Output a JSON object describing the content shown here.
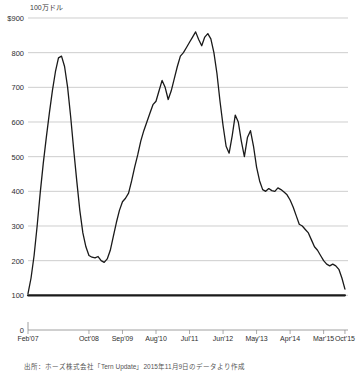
{
  "chart_data": {
    "type": "line",
    "title": "100万ドル",
    "xlabel": "",
    "ylabel": "",
    "ylim": [
      0,
      900
    ],
    "xlim": [
      0,
      105
    ],
    "grid": true,
    "legend": "none",
    "y_ticks": [
      {
        "value": 900,
        "label": "$900"
      },
      {
        "value": 800,
        "label": "800"
      },
      {
        "value": 700,
        "label": "700"
      },
      {
        "value": 600,
        "label": "600"
      },
      {
        "value": 500,
        "label": "500"
      },
      {
        "value": 400,
        "label": "400"
      },
      {
        "value": 300,
        "label": "300"
      },
      {
        "value": 200,
        "label": "200"
      },
      {
        "value": 100,
        "label": "100"
      },
      {
        "value": 0,
        "label": "0"
      }
    ],
    "x_ticks": [
      {
        "index": 0,
        "label": "Feb'07"
      },
      {
        "index": 20,
        "label": "Oct'08"
      },
      {
        "index": 31,
        "label": "Sep'09"
      },
      {
        "index": 42,
        "label": "Aug'10"
      },
      {
        "index": 53,
        "label": "Jul'11"
      },
      {
        "index": 64,
        "label": "Jun'12"
      },
      {
        "index": 75,
        "label": "May'13"
      },
      {
        "index": 86,
        "label": "Apr'14"
      },
      {
        "index": 97,
        "label": "Mar'15"
      },
      {
        "index": 104,
        "label": "Oct'15"
      }
    ],
    "series": [
      {
        "name": "main-series",
        "color": "#1a1a1a",
        "x": [
          0,
          1,
          2,
          3,
          4,
          5,
          6,
          7,
          8,
          9,
          10,
          11,
          12,
          13,
          14,
          15,
          16,
          17,
          18,
          19,
          20,
          21,
          22,
          23,
          24,
          25,
          26,
          27,
          28,
          29,
          30,
          31,
          32,
          33,
          34,
          35,
          36,
          37,
          38,
          39,
          40,
          41,
          42,
          43,
          44,
          45,
          46,
          47,
          48,
          49,
          50,
          51,
          52,
          53,
          54,
          55,
          56,
          57,
          58,
          59,
          60,
          61,
          62,
          63,
          64,
          65,
          66,
          67,
          68,
          69,
          70,
          71,
          72,
          73,
          74,
          75,
          76,
          77,
          78,
          79,
          80,
          81,
          82,
          83,
          84,
          85,
          86,
          87,
          88,
          89,
          90,
          91,
          92,
          93,
          94,
          95,
          96,
          97,
          98,
          99,
          100,
          101,
          102,
          103,
          104
        ],
        "values": [
          105,
          150,
          215,
          300,
          395,
          480,
          555,
          625,
          690,
          745,
          785,
          790,
          760,
          700,
          615,
          520,
          430,
          345,
          280,
          240,
          215,
          210,
          208,
          212,
          200,
          195,
          205,
          230,
          270,
          310,
          345,
          370,
          380,
          395,
          430,
          470,
          505,
          545,
          575,
          600,
          625,
          650,
          660,
          690,
          720,
          700,
          665,
          690,
          725,
          760,
          790,
          800,
          815,
          830,
          845,
          860,
          838,
          820,
          845,
          855,
          840,
          800,
          740,
          660,
          590,
          530,
          510,
          560,
          620,
          600,
          545,
          500,
          555,
          575,
          530,
          470,
          430,
          405,
          400,
          408,
          402,
          400,
          410,
          405,
          398,
          390,
          375,
          355,
          330,
          305,
          300,
          290,
          280,
          260,
          240,
          230,
          215,
          200,
          190,
          185,
          190,
          185,
          175,
          150,
          118
        ]
      },
      {
        "name": "baseline-series",
        "color": "#1a1a1a",
        "x": [
          0,
          104
        ],
        "values": [
          100,
          100
        ]
      }
    ],
    "source_note": "出所：ホーズ株式会社「Tern Update」2015年11月9日のデータより作成"
  }
}
